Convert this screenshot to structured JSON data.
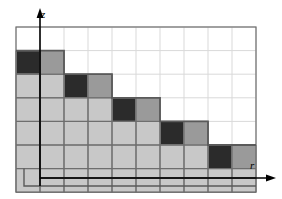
{
  "figure": {
    "name": "staircase-grid-diagram",
    "background": "#ffffff"
  },
  "axes": {
    "vertical": {
      "label": "z",
      "icon": "arrow-up-icon",
      "x": 40,
      "y_top": 14,
      "y_bottom": 186
    },
    "horizontal": {
      "label": "r",
      "icon": "arrow-right-icon",
      "y": 178,
      "x_left": 40,
      "x_right": 270
    }
  },
  "grid": {
    "origin_x": 16,
    "origin_y": 27,
    "cell_w": 24,
    "cell_h": 23.6,
    "cols": 10,
    "rows": 7,
    "line_color": "#d9d9d9",
    "border_color": "#6e6e6e"
  },
  "colors": {
    "dark": "#2b2b2b",
    "medium": "#9a9a9a",
    "light": "#c8c8c8",
    "empty": "#ffffff",
    "outline": "#5a5a5a",
    "axis": "#000000"
  },
  "chart_data": {
    "type": "heatmap",
    "title": "",
    "xlabel": "r",
    "ylabel": "z",
    "categories_x": [
      "0",
      "1",
      "2",
      "3",
      "4",
      "5",
      "6",
      "7",
      "8",
      "9"
    ],
    "categories_y": [
      "6",
      "5",
      "4",
      "3",
      "2",
      "1",
      "0"
    ],
    "legend": [
      {
        "key": "dark",
        "label": "dark cell",
        "color": "#2b2b2b"
      },
      {
        "key": "medium",
        "label": "medium cell",
        "color": "#9a9a9a"
      },
      {
        "key": "light",
        "label": "light cell",
        "color": "#c8c8c8"
      },
      {
        "key": "empty",
        "label": "empty cell",
        "color": "#ffffff"
      }
    ],
    "grid": true,
    "cells": [
      [
        "empty",
        "empty",
        "empty",
        "empty",
        "empty",
        "empty",
        "empty",
        "empty",
        "empty",
        "empty"
      ],
      [
        "dark",
        "medium",
        "empty",
        "empty",
        "empty",
        "empty",
        "empty",
        "empty",
        "empty",
        "empty"
      ],
      [
        "light",
        "light",
        "dark",
        "medium",
        "empty",
        "empty",
        "empty",
        "empty",
        "empty",
        "empty"
      ],
      [
        "light",
        "light",
        "light",
        "light",
        "dark",
        "medium",
        "empty",
        "empty",
        "empty",
        "empty"
      ],
      [
        "light",
        "light",
        "light",
        "light",
        "light",
        "light",
        "dark",
        "medium",
        "empty",
        "empty"
      ],
      [
        "light",
        "light",
        "light",
        "light",
        "light",
        "light",
        "light",
        "light",
        "dark",
        "medium"
      ],
      [
        "light",
        "light",
        "light",
        "light",
        "light",
        "light",
        "light",
        "light",
        "light",
        "light"
      ]
    ],
    "staircase_steps": [
      {
        "step": 1,
        "dark_col": 0,
        "medium_col": 1,
        "row": 1
      },
      {
        "step": 2,
        "dark_col": 2,
        "medium_col": 3,
        "row": 2
      },
      {
        "step": 3,
        "dark_col": 4,
        "medium_col": 5,
        "row": 3
      },
      {
        "step": 4,
        "dark_col": 6,
        "medium_col": 7,
        "row": 4
      },
      {
        "step": 5,
        "dark_col": 8,
        "medium_col": 9,
        "row": 5
      }
    ]
  }
}
